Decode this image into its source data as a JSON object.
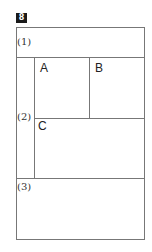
{
  "question_number": "8",
  "sections": [
    {
      "label": "(1)"
    },
    {
      "label": "(2)",
      "cells": [
        {
          "label": "A"
        },
        {
          "label": "B"
        },
        {
          "label": "C"
        }
      ]
    },
    {
      "label": "(3)"
    }
  ]
}
